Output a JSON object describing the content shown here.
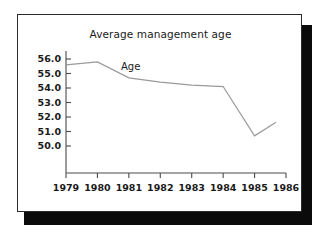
{
  "card": {
    "title": "Average management age",
    "background_color": "#ffffff",
    "border_color": "#2b2b2b",
    "shadow_color": "#0b0b0b"
  },
  "chart_data": {
    "type": "line",
    "title": "Average management age",
    "xlabel": "",
    "ylabel": "",
    "categories": [
      "1979",
      "1980",
      "1981",
      "1982",
      "1983",
      "1984",
      "1985",
      "1986"
    ],
    "x": [
      1979,
      1980,
      1981,
      1982,
      1983,
      1984,
      1985,
      1986
    ],
    "series": [
      {
        "name": "Age",
        "color": "#9a9a9a",
        "values": [
          55.6,
          55.8,
          54.7,
          54.4,
          54.2,
          54.1,
          50.7,
          51.7
        ]
      }
    ],
    "ylim": [
      49.3,
      56.3
    ],
    "xlim": [
      1979,
      1986
    ],
    "ytick_labels": [
      "56.0",
      "55.0",
      "54.0",
      "53.0",
      "52.0",
      "51.0",
      "50.0"
    ],
    "ytick_values": [
      56.0,
      55.0,
      54.0,
      53.0,
      52.0,
      51.0,
      50.0
    ],
    "xtick_labels": [
      "1979",
      "1980",
      "1981",
      "1982",
      "1983",
      "1984",
      "1985",
      "1986"
    ],
    "grid": false,
    "legend": "inline",
    "annotations": [
      {
        "text": "Age",
        "x": 1980.75,
        "y": 55.25
      }
    ]
  }
}
